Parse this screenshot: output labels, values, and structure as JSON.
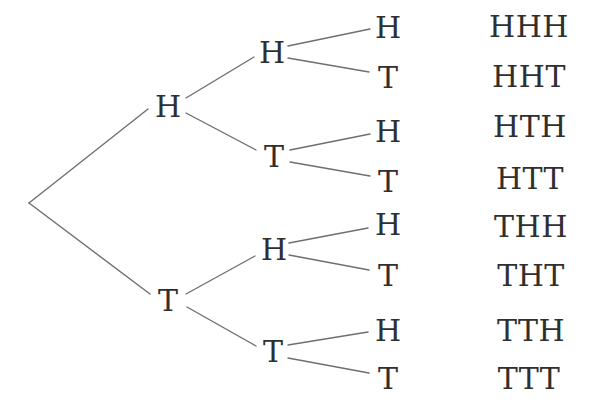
{
  "diagram": {
    "toss1": [
      {
        "label": "H"
      },
      {
        "label": "T"
      }
    ],
    "toss2": [
      {
        "label": "H"
      },
      {
        "label": "T"
      },
      {
        "label": "H"
      },
      {
        "label": "T"
      }
    ],
    "toss3": [
      {
        "label": "H"
      },
      {
        "label": "T"
      },
      {
        "label": "H"
      },
      {
        "label": "T"
      },
      {
        "label": "H"
      },
      {
        "label": "T"
      },
      {
        "label": "H"
      },
      {
        "label": "T"
      }
    ],
    "outcomes": [
      "HHH",
      "HHT",
      "HTH",
      "HTT",
      "THH",
      "THT",
      "TTH",
      "TTT"
    ],
    "colors": {
      "text": "#2f2f2f",
      "line": "#6f6f6f",
      "background": "#ffffff"
    }
  }
}
